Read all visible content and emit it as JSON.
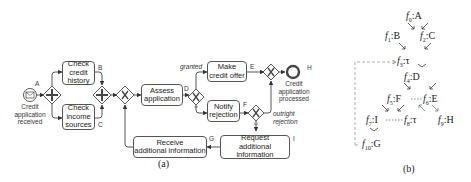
{
  "panel_a": {
    "caption": "(a)",
    "start_event": {
      "label": "Credit\napplication\nreceived",
      "marker": "A"
    },
    "end_event": {
      "label": "Credit\napplication\nprocessed",
      "marker": "H"
    },
    "tasks": [
      {
        "id": "check-credit-history",
        "label": "Check\ncredit\nhistory",
        "marker": "B"
      },
      {
        "id": "check-income-sources",
        "label": "Check\nincome\nsources",
        "marker": "C"
      },
      {
        "id": "assess-application",
        "label": "Assess\napplication",
        "marker": "D"
      },
      {
        "id": "make-credit-offer",
        "label": "Make\ncredit offer",
        "marker": "E"
      },
      {
        "id": "notify-rejection",
        "label": "Notify\nrejection",
        "marker": "F"
      },
      {
        "id": "request-additional-information",
        "label": "Request\nadditional information",
        "marker": "I"
      },
      {
        "id": "receive-additional-information",
        "label": "Receive\nadditional information",
        "marker": "G"
      }
    ],
    "gateways": [
      {
        "id": "and-split",
        "type": "parallel",
        "symbol": "+"
      },
      {
        "id": "and-join",
        "type": "parallel",
        "symbol": "+"
      },
      {
        "id": "xor-merge",
        "type": "exclusive",
        "symbol": "X"
      },
      {
        "id": "xor-decision",
        "type": "exclusive",
        "symbol": "X"
      },
      {
        "id": "xor-rejection",
        "type": "exclusive",
        "symbol": "X"
      },
      {
        "id": "xor-end-merge",
        "type": "exclusive",
        "symbol": "X"
      }
    ],
    "edge_labels": {
      "granted": "granted",
      "outright_rejection": "outright\nrejection"
    }
  },
  "panel_b": {
    "caption": "(b)",
    "nodes": [
      {
        "id": "f0",
        "name": "f",
        "sub": "0",
        "label": ":A"
      },
      {
        "id": "f1",
        "name": "f",
        "sub": "1",
        "label": ":B"
      },
      {
        "id": "f2",
        "name": "f",
        "sub": "2",
        "label": ":C"
      },
      {
        "id": "f3",
        "name": "f",
        "sub": "3",
        "label": ":τ"
      },
      {
        "id": "f4",
        "name": "f",
        "sub": "4",
        "label": ":D"
      },
      {
        "id": "f5",
        "name": "f",
        "sub": "5",
        "label": ":F"
      },
      {
        "id": "f6",
        "name": "f",
        "sub": "6",
        "label": ":E"
      },
      {
        "id": "f7",
        "name": "f",
        "sub": "7",
        "label": ":I"
      },
      {
        "id": "f8",
        "name": "f",
        "sub": "8",
        "label": ":τ"
      },
      {
        "id": "f9",
        "name": "f",
        "sub": "9",
        "label": ":H"
      },
      {
        "id": "f10",
        "name": "f",
        "sub": "10",
        "label": ":G"
      }
    ]
  }
}
